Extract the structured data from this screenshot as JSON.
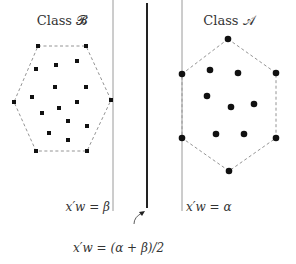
{
  "labels": {
    "class_b": "Class 𝓑",
    "class_a": "Class 𝒜",
    "line_beta": "x′w = β",
    "line_alpha": "x′w = α",
    "line_mid": "x′w = (α + β)/2"
  },
  "colors": {
    "points": "#111111",
    "hull": "#888888",
    "thin_line": "#9a9a9a",
    "thick_line": "#222222",
    "text": "#333333"
  },
  "lines": {
    "beta": {
      "x": 113,
      "y1": 0,
      "y2": 211
    },
    "mid": {
      "x": 147,
      "y1": 3,
      "y2": 208
    },
    "alpha": {
      "x": 182,
      "y1": 0,
      "y2": 211
    }
  },
  "class_b": {
    "marker": "square",
    "hull": [
      [
        38,
        46
      ],
      [
        86,
        46
      ],
      [
        111,
        100
      ],
      [
        87,
        151
      ],
      [
        36,
        151
      ],
      [
        14,
        102
      ]
    ],
    "points": [
      [
        38,
        46
      ],
      [
        86,
        46
      ],
      [
        36,
        69
      ],
      [
        56,
        65
      ],
      [
        77,
        61
      ],
      [
        55,
        87
      ],
      [
        86,
        87
      ],
      [
        14,
        102
      ],
      [
        32,
        97
      ],
      [
        111,
        100
      ],
      [
        59,
        108
      ],
      [
        77,
        102
      ],
      [
        42,
        113
      ],
      [
        68,
        121
      ],
      [
        87,
        126
      ],
      [
        49,
        133
      ],
      [
        68,
        140
      ],
      [
        36,
        151
      ],
      [
        87,
        151
      ]
    ]
  },
  "class_a": {
    "marker": "circle",
    "hull": [
      [
        228,
        39
      ],
      [
        276,
        73
      ],
      [
        276,
        138
      ],
      [
        229,
        171
      ],
      [
        182,
        138
      ],
      [
        182,
        74
      ]
    ],
    "points": [
      [
        228,
        39
      ],
      [
        182,
        74
      ],
      [
        276,
        73
      ],
      [
        210,
        70
      ],
      [
        238,
        73
      ],
      [
        207,
        96
      ],
      [
        231,
        107
      ],
      [
        254,
        104
      ],
      [
        182,
        138
      ],
      [
        276,
        138
      ],
      [
        216,
        134
      ],
      [
        244,
        134
      ],
      [
        229,
        171
      ]
    ]
  }
}
